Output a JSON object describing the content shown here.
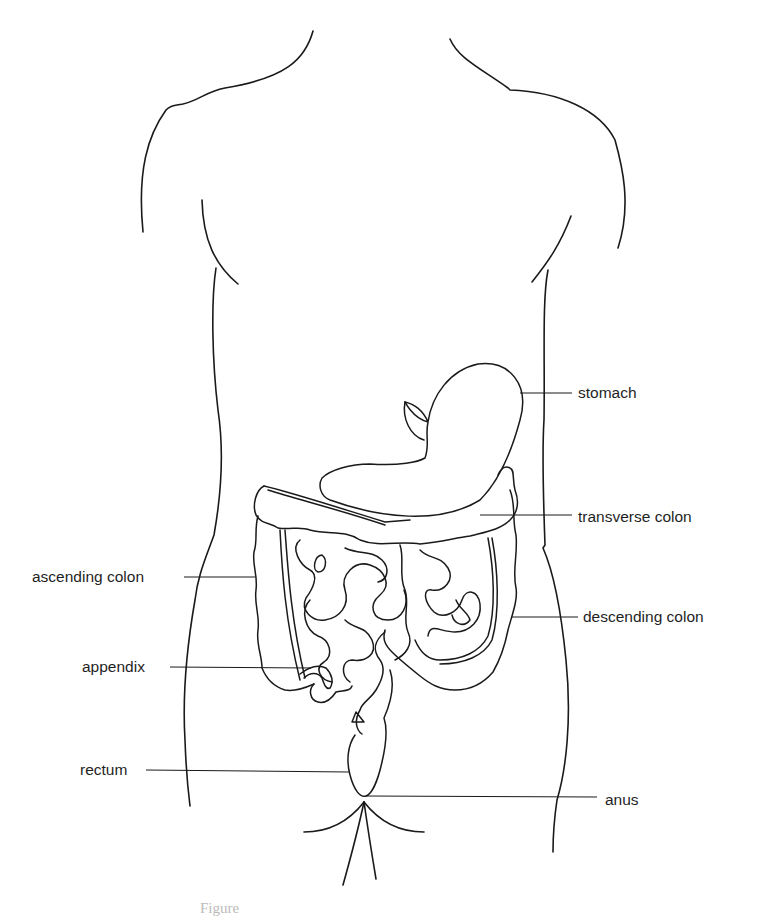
{
  "figure": {
    "caption": "Figure",
    "colors": {
      "line": "#1a1a1a",
      "text": "#1f1f1f",
      "background": "#ffffff"
    }
  },
  "labels": [
    {
      "id": "stomach",
      "text": "stomach"
    },
    {
      "id": "transverse_colon",
      "text": "transverse colon"
    },
    {
      "id": "ascending_colon",
      "text": "ascending colon"
    },
    {
      "id": "descending_colon",
      "text": "descending colon"
    },
    {
      "id": "appendix",
      "text": "appendix"
    },
    {
      "id": "rectum",
      "text": "rectum"
    },
    {
      "id": "anus",
      "text": "anus"
    }
  ]
}
